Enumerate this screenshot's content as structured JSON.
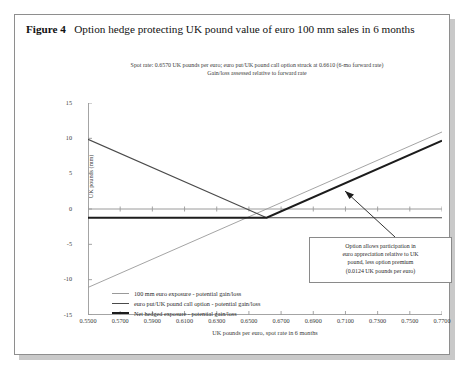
{
  "figure": {
    "number_label": "Figure 4",
    "title": "Option hedge protecting UK pound value of euro 100 mm sales in 6 months",
    "subtitle_line1": "Spot rate: 0.6570 UK pounds per euro; euro put/UK pound call option struck at 0.6610 (6-mo forward rate)",
    "subtitle_line2": "Gain/loss assessed relative to forward rate"
  },
  "annotation": {
    "line1": "Option allows participation in",
    "line2": "euro appreciation relative to UK",
    "line3": "pound, less option premium",
    "line4": "(0.0124 UK pounds per euro)"
  },
  "colors": {
    "exposure": "#9a9a9a",
    "option": "#4a4a4a",
    "net_hedged": "#1c1c1c",
    "axis": "#9a9a9a",
    "frame": "#8e8e8e"
  },
  "chart_data": {
    "type": "line",
    "title": "Option hedge protecting UK pound value of euro 100 mm sales in 6 months",
    "subtitle": "Spot rate: 0.6570 UK pounds per euro; euro put/UK pound call option struck at 0.6610 (6-mo forward rate). Gain/loss assessed relative to forward rate",
    "xlabel": "UK pounds per euro, spot rate in 6 months",
    "ylabel": "UK pounds (mm)",
    "xlim": [
      0.55,
      0.77
    ],
    "ylim": [
      -15,
      15
    ],
    "xticks": [
      "0.5500",
      "0.5700",
      "0.5900",
      "0.6100",
      "0.6300",
      "0.6500",
      "0.6700",
      "0.6900",
      "0.7100",
      "0.7300",
      "0.7500",
      "0.7700"
    ],
    "xtick_values": [
      0.55,
      0.57,
      0.59,
      0.61,
      0.63,
      0.65,
      0.67,
      0.69,
      0.71,
      0.73,
      0.75,
      0.77
    ],
    "yticks": [
      "15",
      "10",
      "5",
      "0",
      "-5",
      "-10",
      "-15"
    ],
    "ytick_values": [
      15,
      10,
      5,
      0,
      -5,
      -10,
      -15
    ],
    "grid": false,
    "legend_position": "inside-bottom-left",
    "strike": 0.661,
    "spot_rate": 0.657,
    "option_premium_per_euro": 0.0124,
    "notional_mm_euro": 100,
    "series": [
      {
        "name": "100 mm euro exposure - potential gain/loss",
        "color": "#9a9a9a",
        "width": 0.9,
        "points": [
          [
            0.55,
            -11.1
          ],
          [
            0.77,
            10.9
          ]
        ]
      },
      {
        "name": "euro put/UK pound call option - potential gain/loss",
        "color": "#4a4a4a",
        "width": 1.2,
        "points": [
          [
            0.55,
            9.86
          ],
          [
            0.661,
            -1.24
          ],
          [
            0.77,
            -1.24
          ]
        ]
      },
      {
        "name": "Net hedged exposure - potential gain/loss",
        "color": "#1c1c1c",
        "width": 2.0,
        "points": [
          [
            0.55,
            -1.24
          ],
          [
            0.661,
            -1.24
          ],
          [
            0.77,
            9.66
          ]
        ]
      }
    ]
  }
}
